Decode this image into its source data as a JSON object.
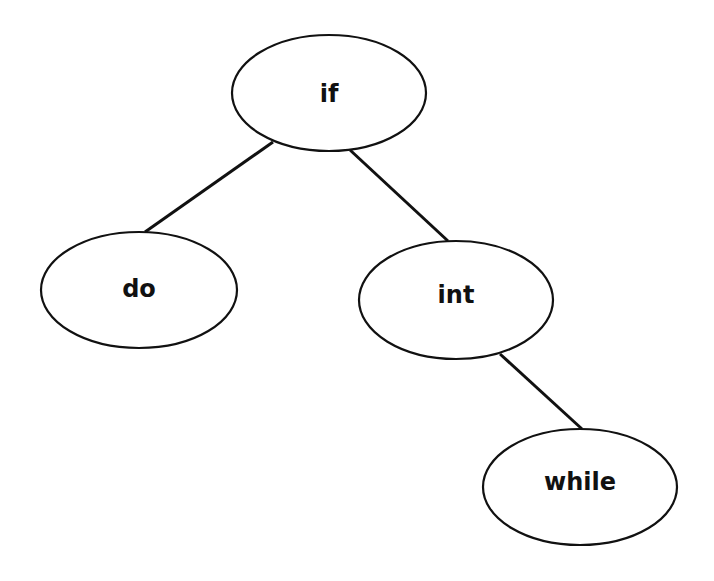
{
  "diagram": {
    "type": "binary-tree",
    "nodes": [
      {
        "id": "if",
        "label": "if",
        "cx": 329,
        "cy": 93,
        "rx": 97,
        "ry": 58
      },
      {
        "id": "do",
        "label": "do",
        "cx": 139,
        "cy": 290,
        "rx": 98,
        "ry": 58
      },
      {
        "id": "int",
        "label": "int",
        "cx": 456,
        "cy": 300,
        "rx": 97,
        "ry": 59
      },
      {
        "id": "while",
        "label": "while",
        "cx": 580,
        "cy": 487,
        "rx": 97,
        "ry": 58
      }
    ],
    "edges": [
      {
        "from": "if",
        "to": "do",
        "side": "left"
      },
      {
        "from": "if",
        "to": "int",
        "side": "right"
      },
      {
        "from": "int",
        "to": "while",
        "side": "right"
      }
    ],
    "colors": {
      "stroke": "#111111",
      "fill": "#ffffff",
      "background": "#ffffff"
    }
  }
}
